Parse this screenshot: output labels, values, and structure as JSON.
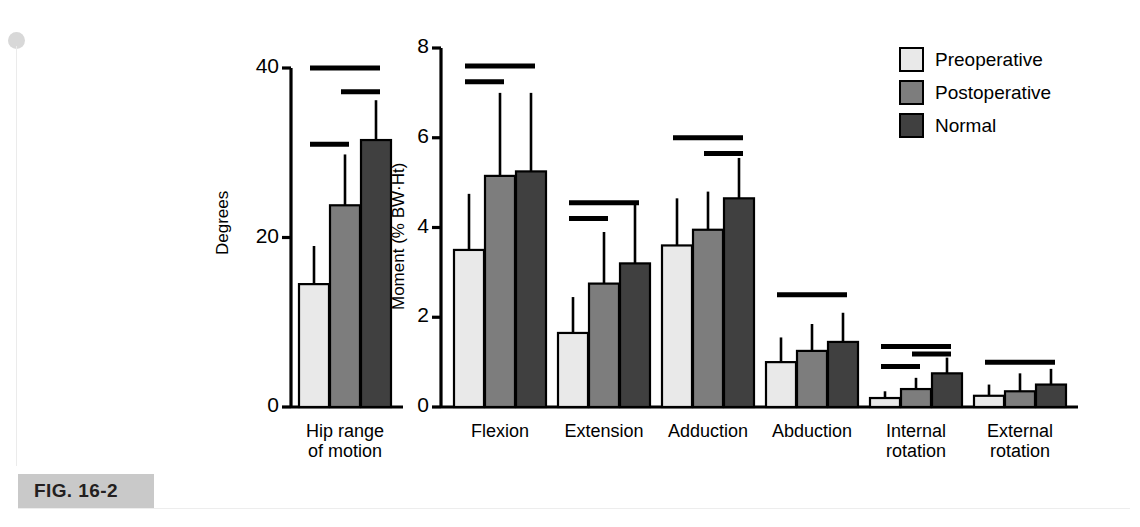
{
  "figure": {
    "caption": "FIG. 16-2",
    "background": "#ffffff",
    "caption_band_color": "#c9c9c9"
  },
  "legend": {
    "position": "top-right",
    "items": [
      {
        "label": "Preoperative",
        "color": "#e9e9e9"
      },
      {
        "label": "Postoperative",
        "color": "#7d7d7d"
      },
      {
        "label": "Normal",
        "color": "#404040"
      }
    ]
  },
  "chart_data": [
    {
      "type": "bar",
      "panel": "left",
      "title": "",
      "xlabel": "",
      "ylabel": "Degrees",
      "ylim": [
        0,
        40
      ],
      "yticks": [
        0,
        20,
        40
      ],
      "ytick_labels": [
        "0",
        "20",
        "40"
      ],
      "grid": false,
      "categories": [
        "Hip range of motion"
      ],
      "category_label_lines": [
        [
          "Hip range",
          "of motion"
        ]
      ],
      "series": [
        {
          "name": "Preoperative",
          "color": "#e9e9e9",
          "values": [
            14.5
          ],
          "errors": [
            4.5
          ]
        },
        {
          "name": "Postoperative",
          "color": "#7d7d7d",
          "values": [
            23.8
          ],
          "errors": [
            6.0
          ]
        },
        {
          "name": "Normal",
          "color": "#404040",
          "values": [
            31.5
          ],
          "errors": [
            4.7
          ]
        }
      ],
      "significance_bars": [
        {
          "from": "Preoperative",
          "to": "Normal",
          "y": 40.0
        },
        {
          "from": "Postoperative",
          "to": "Normal",
          "y": 37.2
        },
        {
          "from": "Preoperative",
          "to": "Postoperative",
          "y": 31.0
        }
      ]
    },
    {
      "type": "bar",
      "panel": "right",
      "title": "",
      "xlabel": "",
      "ylabel": "Moment (% BW·Ht)",
      "ylim": [
        0,
        8
      ],
      "yticks": [
        0,
        2,
        4,
        6,
        8
      ],
      "ytick_labels": [
        "0",
        "2",
        "4",
        "6",
        "8"
      ],
      "grid": false,
      "categories": [
        "Flexion",
        "Extension",
        "Adduction",
        "Abduction",
        "Internal rotation",
        "External rotation"
      ],
      "category_label_lines": [
        [
          "Flexion"
        ],
        [
          "Extension"
        ],
        [
          "Adduction"
        ],
        [
          "Abduction"
        ],
        [
          "Internal",
          "rotation"
        ],
        [
          "External",
          "rotation"
        ]
      ],
      "series": [
        {
          "name": "Preoperative",
          "color": "#e9e9e9",
          "values": [
            3.5,
            1.65,
            3.6,
            1.0,
            0.2,
            0.25
          ],
          "errors": [
            1.25,
            0.8,
            1.05,
            0.55,
            0.15,
            0.25
          ]
        },
        {
          "name": "Postoperative",
          "color": "#7d7d7d",
          "values": [
            5.15,
            2.75,
            3.95,
            1.25,
            0.4,
            0.35
          ],
          "errors": [
            1.85,
            1.15,
            0.85,
            0.6,
            0.25,
            0.4
          ]
        },
        {
          "name": "Normal",
          "color": "#404040",
          "values": [
            5.25,
            3.2,
            4.65,
            1.45,
            0.75,
            0.5
          ],
          "errors": [
            1.75,
            1.35,
            0.9,
            0.65,
            0.35,
            0.35
          ]
        }
      ],
      "significance_bars": [
        {
          "group": "Flexion",
          "from": "Preoperative",
          "to": "Normal",
          "y": 7.6
        },
        {
          "group": "Flexion",
          "from": "Preoperative",
          "to": "Postoperative",
          "y": 7.25
        },
        {
          "group": "Extension",
          "from": "Preoperative",
          "to": "Normal",
          "y": 4.55
        },
        {
          "group": "Extension",
          "from": "Preoperative",
          "to": "Postoperative",
          "y": 4.2
        },
        {
          "group": "Adduction",
          "from": "Preoperative",
          "to": "Normal",
          "y": 6.0
        },
        {
          "group": "Adduction",
          "from": "Postoperative",
          "to": "Normal",
          "y": 5.65
        },
        {
          "group": "Abduction",
          "from": "Preoperative",
          "to": "Normal",
          "y": 2.5
        },
        {
          "group": "Internal rotation",
          "from": "Preoperative",
          "to": "Normal",
          "y": 1.35
        },
        {
          "group": "Internal rotation",
          "from": "Postoperative",
          "to": "Normal",
          "y": 1.18
        },
        {
          "group": "Internal rotation",
          "from": "Preoperative",
          "to": "Postoperative",
          "y": 0.9
        },
        {
          "group": "External rotation",
          "from": "Preoperative",
          "to": "Normal",
          "y": 1.0
        }
      ]
    }
  ]
}
